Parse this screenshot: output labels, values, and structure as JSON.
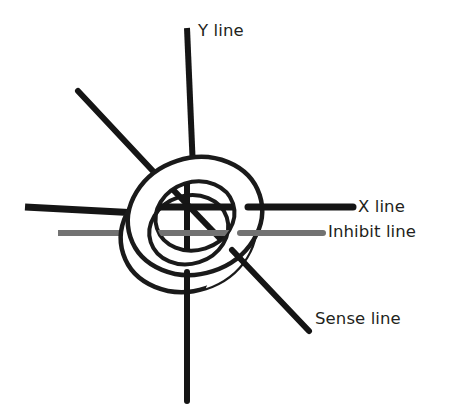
{
  "figure": {
    "name": "magnetic-core-memory-wiring",
    "background_color": "#ffffff",
    "width": 460,
    "height": 419
  },
  "core": {
    "name": "ferrite-core-torus",
    "stroke_color": "#1a1a1a",
    "fill_color": "#ffffff",
    "center_x": 195,
    "center_y": 216,
    "outer_rx": 68,
    "outer_ry": 58,
    "inner_rx": 40,
    "inner_ry": 34,
    "rotation_deg": -18,
    "depth_offset_x": -12,
    "depth_offset_y": 14
  },
  "wires": [
    {
      "id": "y-line",
      "label": "Y line",
      "color": "#151515",
      "thickness": 6,
      "orientation": "vertical",
      "x1": 187,
      "y1": 28,
      "x2": 187,
      "y2": 401
    },
    {
      "id": "x-line",
      "label": "X line",
      "color": "#151515",
      "thickness": 7,
      "orientation": "horizontal",
      "x1": 25,
      "y1": 207,
      "x2": 353,
      "y2": 207
    },
    {
      "id": "inhibit-line",
      "label": "Inhibit line",
      "color": "#727272",
      "thickness": 6,
      "orientation": "horizontal",
      "x1": 58,
      "y1": 233,
      "x2": 323,
      "y2": 233
    },
    {
      "id": "sense-line",
      "label": "Sense line",
      "color": "#151515",
      "thickness": 6,
      "orientation": "diagonal",
      "x1": 78,
      "y1": 91,
      "x2": 309,
      "y2": 331
    }
  ],
  "labels": {
    "y_line": "Y line",
    "x_line": "X line",
    "inhibit_line": "Inhibit line",
    "sense_line": "Sense line"
  },
  "colors": {
    "wire_dark": "#151515",
    "wire_gray": "#727272",
    "text": "#231f20",
    "core_stroke": "#1a1a1a",
    "background": "#ffffff"
  }
}
